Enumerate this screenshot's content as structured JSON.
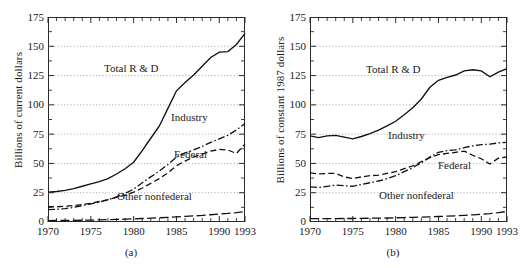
{
  "figure": {
    "panels": [
      {
        "caption": "(a)",
        "ylabel": "Billions of current dollars",
        "labels": {
          "total": "Total R & D",
          "industry": "Industry",
          "federal": "Federal",
          "other": "Other nonfederal"
        }
      },
      {
        "caption": "(b)",
        "ylabel": "Billions of constant 1987 dollars",
        "labels": {
          "total": "Total R & D",
          "industry": "Industry",
          "federal": "Federal",
          "other": "Other nonfederal"
        }
      }
    ],
    "yticks": [
      "175",
      "150",
      "125",
      "100",
      "75",
      "50",
      "25",
      "0"
    ],
    "xticks": [
      "1970",
      "1975",
      "1980",
      "1985",
      "1990",
      "1993"
    ]
  },
  "chart_data": [
    {
      "type": "line",
      "title": "(a)",
      "xlabel": "",
      "ylabel": "Billions of current dollars",
      "xlim": [
        1970,
        1993
      ],
      "ylim": [
        0,
        175
      ],
      "ytick_values": [
        0,
        25,
        50,
        75,
        100,
        125,
        150,
        175
      ],
      "xtick_values": [
        1970,
        1975,
        1980,
        1985,
        1990,
        1993
      ],
      "grid": "horizontal-dotted",
      "legend": "inline-annotations",
      "x": [
        1970,
        1971,
        1972,
        1973,
        1974,
        1975,
        1976,
        1977,
        1978,
        1979,
        1980,
        1981,
        1982,
        1983,
        1984,
        1985,
        1986,
        1987,
        1988,
        1989,
        1990,
        1991,
        1992,
        1993
      ],
      "series": [
        {
          "name": "Total R & D",
          "style": "solid",
          "values": [
            25.5,
            26.0,
            27.0,
            28.5,
            30.5,
            32.5,
            34.5,
            37.0,
            41.0,
            45.5,
            51.0,
            61.0,
            71.5,
            82.0,
            97.0,
            112.0,
            119.0,
            125.5,
            133.0,
            140.5,
            145.0,
            145.5,
            151.5,
            161.0
          ]
        },
        {
          "name": "Industry",
          "style": "dash-dot",
          "values": [
            10.5,
            10.8,
            11.5,
            12.5,
            14.0,
            15.5,
            17.0,
            19.0,
            21.5,
            24.5,
            28.0,
            33.5,
            38.5,
            43.5,
            49.0,
            55.5,
            59.0,
            61.5,
            64.5,
            68.0,
            71.0,
            74.0,
            78.5,
            84.0
          ]
        },
        {
          "name": "Federal",
          "style": "dashed",
          "values": [
            13.0,
            13.0,
            13.5,
            14.0,
            15.0,
            16.0,
            17.5,
            19.0,
            21.0,
            23.0,
            25.5,
            29.0,
            33.0,
            37.0,
            42.0,
            48.0,
            52.0,
            55.5,
            58.0,
            60.5,
            62.0,
            61.5,
            58.5,
            66.5
          ]
        },
        {
          "name": "Other nonfederal",
          "style": "long-dash",
          "values": [
            1.2,
            1.3,
            1.3,
            1.4,
            1.5,
            1.6,
            1.8,
            2.0,
            2.2,
            2.4,
            2.7,
            3.0,
            3.3,
            3.6,
            4.0,
            4.4,
            4.8,
            5.2,
            5.6,
            6.2,
            6.8,
            7.3,
            8.0,
            9.0
          ]
        }
      ]
    },
    {
      "type": "line",
      "title": "(b)",
      "xlabel": "",
      "ylabel": "Billions of constant 1987 dollars",
      "xlim": [
        1970,
        1993
      ],
      "ylim": [
        0,
        175
      ],
      "ytick_values": [
        0,
        25,
        50,
        75,
        100,
        125,
        150,
        175
      ],
      "xtick_values": [
        1970,
        1975,
        1980,
        1985,
        1990,
        1993
      ],
      "grid": "horizontal-dotted",
      "legend": "inline-annotations",
      "x": [
        1970,
        1971,
        1972,
        1973,
        1974,
        1975,
        1976,
        1977,
        1978,
        1979,
        1980,
        1981,
        1982,
        1983,
        1984,
        1985,
        1986,
        1987,
        1988,
        1989,
        1990,
        1991,
        1992,
        1993
      ],
      "series": [
        {
          "name": "Total R & D",
          "style": "solid",
          "values": [
            73.5,
            72.0,
            73.5,
            74.0,
            72.5,
            71.0,
            73.0,
            75.5,
            78.5,
            82.0,
            86.0,
            91.5,
            97.5,
            105.0,
            115.0,
            121.0,
            123.5,
            125.5,
            129.0,
            130.0,
            129.0,
            124.0,
            128.0,
            131.0
          ]
        },
        {
          "name": "Industry",
          "style": "dash-dot",
          "values": [
            30.0,
            29.5,
            30.5,
            31.5,
            31.0,
            30.5,
            32.0,
            33.5,
            35.0,
            37.0,
            39.5,
            43.0,
            46.5,
            50.5,
            55.5,
            59.5,
            61.0,
            61.5,
            63.5,
            65.0,
            66.0,
            66.5,
            67.5,
            68.0
          ]
        },
        {
          "name": "Federal",
          "style": "dashed",
          "values": [
            42.0,
            41.0,
            41.5,
            41.5,
            38.5,
            37.0,
            38.5,
            39.5,
            40.0,
            41.5,
            43.0,
            45.5,
            48.0,
            51.5,
            55.0,
            57.5,
            58.5,
            59.5,
            60.5,
            57.0,
            54.0,
            49.5,
            54.5,
            55.5
          ]
        },
        {
          "name": "Other nonfederal",
          "style": "long-dash",
          "values": [
            2.8,
            2.8,
            2.9,
            2.9,
            3.0,
            3.0,
            3.1,
            3.2,
            3.3,
            3.4,
            3.6,
            3.8,
            4.0,
            4.2,
            4.4,
            4.7,
            5.0,
            5.3,
            5.7,
            6.1,
            6.6,
            7.2,
            8.0,
            9.0
          ]
        }
      ]
    }
  ]
}
